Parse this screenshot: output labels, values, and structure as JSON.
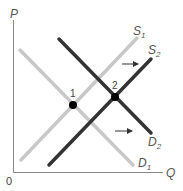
{
  "diagram": {
    "type": "supply-demand",
    "axes": {
      "y_label": "P",
      "x_label": "Q",
      "origin_label": "0"
    },
    "curves": [
      {
        "id": "S1",
        "label": "S",
        "subscript": "1",
        "kind": "supply",
        "color": "#c8c8c8"
      },
      {
        "id": "S2",
        "label": "S",
        "subscript": "2",
        "kind": "supply",
        "color": "#333333"
      },
      {
        "id": "D1",
        "label": "D",
        "subscript": "1",
        "kind": "demand",
        "color": "#c8c8c8"
      },
      {
        "id": "D2",
        "label": "D",
        "subscript": "2",
        "kind": "demand",
        "color": "#333333"
      }
    ],
    "points": [
      {
        "id": "1",
        "label": "1",
        "description": "equilibrium of S1 and D1"
      },
      {
        "id": "2",
        "label": "2",
        "description": "equilibrium of S2 and D2"
      }
    ],
    "arrows": [
      {
        "id": "supply-shift",
        "direction": "right"
      },
      {
        "id": "demand-shift",
        "direction": "right"
      }
    ]
  }
}
